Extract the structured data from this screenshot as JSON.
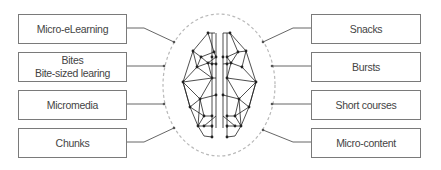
{
  "diagram": {
    "title": "",
    "center": {
      "label": "",
      "icon": "brain-network-icon",
      "outline": "dashed-ellipse",
      "outline_color": "#b8b8b8",
      "line_color": "#222222"
    },
    "left_terms": [
      {
        "lines": [
          "Micro-eLearning"
        ]
      },
      {
        "lines": [
          "Bites",
          "Bite-sized learing"
        ]
      },
      {
        "lines": [
          "Micromedia"
        ]
      },
      {
        "lines": [
          "Chunks"
        ]
      }
    ],
    "right_terms": [
      {
        "lines": [
          "Snacks"
        ]
      },
      {
        "lines": [
          "Bursts"
        ]
      },
      {
        "lines": [
          "Short courses"
        ]
      },
      {
        "lines": [
          "Micro-content"
        ]
      }
    ],
    "colors": {
      "box_border": "#7a7a7a",
      "connector": "#555555",
      "text": "#444444"
    }
  }
}
